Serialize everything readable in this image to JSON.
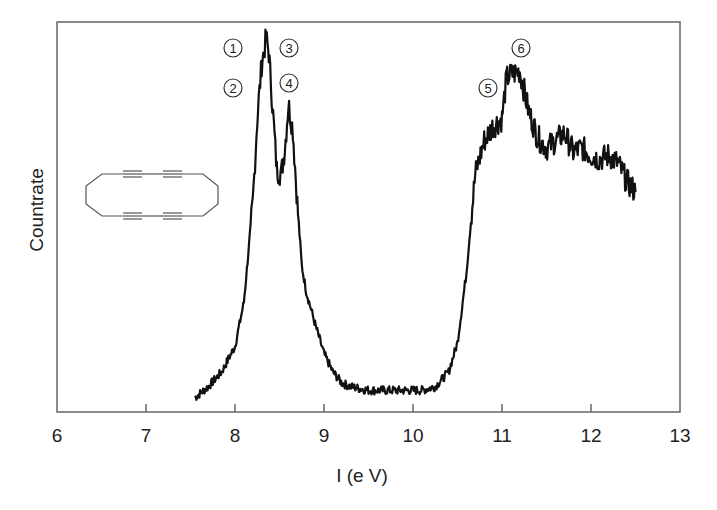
{
  "chart_data": {
    "type": "line",
    "title": "",
    "xlabel": "I (e V)",
    "ylabel": "Countrate",
    "xlim": [
      6,
      13
    ],
    "ylim": [
      0,
      100
    ],
    "x_ticks": [
      "6",
      "7",
      "8",
      "9",
      "10",
      "11",
      "12",
      "13"
    ],
    "y_ticks": [],
    "grid": false,
    "legend": null,
    "series": [
      {
        "name": "photoelectron spectrum",
        "x": [
          7.55,
          7.7,
          7.85,
          8.0,
          8.1,
          8.2,
          8.25,
          8.3,
          8.35,
          8.38,
          8.42,
          8.47,
          8.52,
          8.56,
          8.6,
          8.65,
          8.7,
          8.75,
          8.8,
          8.9,
          9.0,
          9.1,
          9.2,
          9.3,
          9.5,
          9.7,
          9.9,
          10.1,
          10.25,
          10.4,
          10.5,
          10.6,
          10.65,
          10.7,
          10.8,
          10.9,
          11.0,
          11.05,
          11.1,
          11.2,
          11.3,
          11.4,
          11.5,
          11.6,
          11.7,
          11.8,
          11.9,
          12.0,
          12.1,
          12.2,
          12.3,
          12.4,
          12.5
        ],
        "y": [
          2,
          5,
          9,
          16,
          28,
          55,
          78,
          93,
          100,
          96,
          82,
          64,
          63,
          70,
          82,
          75,
          55,
          38,
          31,
          22,
          14,
          9,
          6,
          5,
          4,
          4,
          4,
          4,
          5,
          9,
          17,
          36,
          50,
          63,
          72,
          76,
          78,
          89,
          90,
          91,
          80,
          73,
          70,
          72,
          74,
          69,
          70,
          68,
          67,
          68,
          66,
          61,
          58
        ]
      }
    ],
    "annotations": [
      {
        "label": "1",
        "x": 8.0,
        "y": 95
      },
      {
        "label": "2",
        "x": 8.0,
        "y": 85
      },
      {
        "label": "3",
        "x": 8.6,
        "y": 96
      },
      {
        "label": "4",
        "x": 8.6,
        "y": 86
      },
      {
        "label": "5",
        "x": 10.85,
        "y": 83
      },
      {
        "label": "6",
        "x": 11.25,
        "y": 92
      }
    ],
    "inset": "cyclic polyyne ring schematic (octagon with two triple-bond pairs on top and bottom edges)"
  },
  "ui": {
    "colors": {
      "line": "#111111",
      "axis": "#555555",
      "text": "#222222",
      "inset": "#555555"
    }
  }
}
